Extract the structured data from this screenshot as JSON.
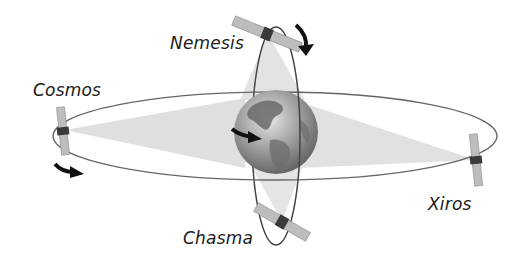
{
  "diagram": {
    "type": "satellite-orbits",
    "center_body": "Earth",
    "satellites": [
      {
        "name": "Nemesis",
        "orbit": "polar"
      },
      {
        "name": "Cosmos",
        "orbit": "equatorial"
      },
      {
        "name": "Xiros",
        "orbit": "equatorial"
      },
      {
        "name": "Chasma",
        "orbit": "polar"
      }
    ],
    "labels": {
      "nemesis": "Nemesis",
      "cosmos": "Cosmos",
      "xiros": "Xiros",
      "chasma": "Chasma"
    },
    "colors": {
      "orbit_line": "#555555",
      "beam": "#d8d8d8",
      "globe_dark": "#5a5a5a",
      "globe_light": "#d0d0d0",
      "panel": "#bdbdbd",
      "body": "#3a3a3a",
      "arrow": "#111111"
    }
  }
}
